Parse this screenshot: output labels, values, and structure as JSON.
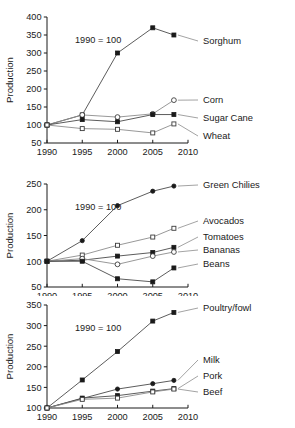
{
  "figure": {
    "axis_title": "Production",
    "annotation": "1990 = 100",
    "xticks": [
      "1990",
      "1995",
      "2000",
      "2005",
      "2010"
    ]
  },
  "chart_data": [
    {
      "type": "line",
      "title": "",
      "xlabel": "",
      "ylabel": "Production",
      "annotation": "1990 = 100",
      "x": [
        1990,
        1995,
        2000,
        2005,
        2008
      ],
      "xlim": [
        1990,
        2010
      ],
      "ylim": [
        50,
        400
      ],
      "yticks": [
        50,
        100,
        150,
        200,
        250,
        300,
        350,
        400
      ],
      "xticks": [
        1990,
        1995,
        2000,
        2005,
        2010
      ],
      "grid": false,
      "legend_position": "right-inline",
      "series": [
        {
          "name": "Sorghum",
          "marker": "filled-square",
          "values": [
            100,
            128,
            300,
            370,
            350
          ]
        },
        {
          "name": "Corn",
          "marker": "open-circle",
          "values": [
            100,
            128,
            122,
            131,
            169
          ]
        },
        {
          "name": "Sugar Cane",
          "marker": "filled-square",
          "values": [
            100,
            115,
            109,
            129,
            129
          ]
        },
        {
          "name": "Wheat",
          "marker": "open-square",
          "values": [
            100,
            90,
            88,
            78,
            103
          ]
        }
      ]
    },
    {
      "type": "line",
      "title": "",
      "xlabel": "",
      "ylabel": "Production",
      "annotation": "1990 = 100",
      "x": [
        1990,
        1995,
        2000,
        2005,
        2008
      ],
      "xlim": [
        1990,
        2010
      ],
      "ylim": [
        50,
        250
      ],
      "yticks": [
        50,
        100,
        150,
        200,
        250
      ],
      "xticks": [
        1990,
        1995,
        2000,
        2005,
        2010
      ],
      "grid": false,
      "legend_position": "right-inline",
      "series": [
        {
          "name": "Green Chilies",
          "marker": "filled-circle",
          "values": [
            100,
            140,
            208,
            236,
            246
          ]
        },
        {
          "name": "Avocados",
          "marker": "open-square",
          "values": [
            100,
            112,
            131,
            147,
            164
          ]
        },
        {
          "name": "Tomatoes",
          "marker": "filled-square",
          "values": [
            100,
            102,
            110,
            117,
            127
          ]
        },
        {
          "name": "Bananas",
          "marker": "open-circle",
          "values": [
            100,
            105,
            94,
            110,
            118
          ]
        },
        {
          "name": "Beans",
          "marker": "filled-square",
          "values": [
            100,
            100,
            66,
            60,
            87
          ]
        }
      ]
    },
    {
      "type": "line",
      "title": "",
      "xlabel": "",
      "ylabel": "Production",
      "annotation": "1990 = 100",
      "x": [
        1990,
        1995,
        2000,
        2005,
        2008
      ],
      "xlim": [
        1990,
        2010
      ],
      "ylim": [
        100,
        350
      ],
      "yticks": [
        100,
        150,
        200,
        250,
        300,
        350
      ],
      "xticks": [
        1990,
        1995,
        2000,
        2005,
        2010
      ],
      "grid": false,
      "legend_position": "right-inline",
      "series": [
        {
          "name": "Poultry/fowl",
          "marker": "filled-square",
          "values": [
            100,
            168,
            237,
            311,
            332
          ]
        },
        {
          "name": "Milk",
          "marker": "filled-circle",
          "values": [
            100,
            123,
            146,
            159,
            167
          ]
        },
        {
          "name": "Pork",
          "marker": "filled-square",
          "values": [
            100,
            124,
            130,
            141,
            147
          ]
        },
        {
          "name": "Beef",
          "marker": "open-square",
          "values": [
            100,
            121,
            124,
            139,
            146
          ]
        }
      ]
    }
  ]
}
